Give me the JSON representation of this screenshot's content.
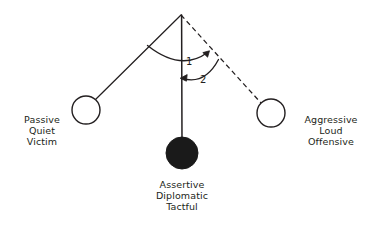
{
  "diagram": {
    "type": "pendulum-continuum",
    "colors": {
      "stroke": "#231f20",
      "text": "#231f20",
      "fill_ball": "#1a1a1a",
      "background": "#ffffff"
    },
    "pivot": {
      "x": 181,
      "y": 15
    },
    "nodes": [
      {
        "id": "passive",
        "style": "open-circle",
        "center": {
          "x": 86,
          "y": 110
        },
        "radius": 14,
        "line_style": "solid",
        "label_lines": [
          "Passive",
          "Quiet",
          "Victim"
        ]
      },
      {
        "id": "assertive",
        "style": "filled-circle",
        "center": {
          "x": 182,
          "y": 153
        },
        "radius": 16,
        "line_style": "solid",
        "label_lines": [
          "Assertive",
          "Diplomatic",
          "Tactful"
        ]
      },
      {
        "id": "aggressive",
        "style": "open-circle",
        "center": {
          "x": 271,
          "y": 113
        },
        "radius": 14,
        "line_style": "dashed",
        "label_lines": [
          "Aggressive",
          "Loud",
          "Offensive"
        ]
      }
    ],
    "arcs": [
      {
        "id": "arc-1",
        "number": "1",
        "direction": "left-to-right",
        "from": "passive-arm",
        "to": "aggressive-arm",
        "arrow_at": "end",
        "number_position": {
          "x": 190,
          "y": 63
        }
      },
      {
        "id": "arc-2",
        "number": "2",
        "direction": "right-to-left",
        "from": "aggressive-arm",
        "to": "assertive-arm",
        "arrow_at": "end",
        "number_position": {
          "x": 204,
          "y": 81
        }
      }
    ]
  }
}
